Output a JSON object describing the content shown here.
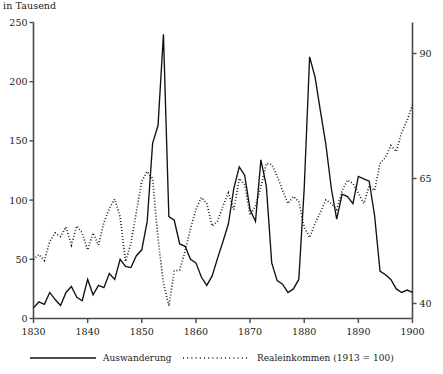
{
  "chart_data": {
    "type": "line",
    "title": "",
    "unit_note": "in Tausend",
    "xlabel": "",
    "ylabel": "",
    "xlim": [
      1830,
      1900
    ],
    "x_ticks": [
      1830,
      1840,
      1850,
      1860,
      1870,
      1880,
      1890,
      1900
    ],
    "x_tick_labels": [
      "1830",
      "1840",
      "1850",
      "1860",
      "1870",
      "1880",
      "1890",
      "1900"
    ],
    "left_axis": {
      "label": "in Tausend",
      "ylim": [
        0,
        250
      ],
      "ticks": [
        0,
        50,
        100,
        150,
        200,
        250
      ],
      "tick_labels": [
        "0",
        "50",
        "100",
        "150",
        "200",
        "250"
      ]
    },
    "right_axis": {
      "label": "Realeinkommen (1913 = 100)",
      "ylim": [
        37,
        96.2
      ],
      "ticks": [
        40,
        65,
        90
      ],
      "tick_labels": [
        "40",
        "65",
        "90"
      ]
    },
    "grid": false,
    "legend_position": "below-plot",
    "series": [
      {
        "name": "Auswanderung",
        "style": "solid",
        "axis": "left",
        "color": "#111111",
        "x": [
          1830,
          1831,
          1832,
          1833,
          1834,
          1835,
          1836,
          1837,
          1838,
          1839,
          1840,
          1841,
          1842,
          1843,
          1844,
          1845,
          1846,
          1847,
          1848,
          1849,
          1850,
          1851,
          1852,
          1853,
          1854,
          1855,
          1856,
          1857,
          1858,
          1859,
          1860,
          1861,
          1862,
          1863,
          1864,
          1865,
          1866,
          1867,
          1868,
          1869,
          1870,
          1871,
          1872,
          1873,
          1874,
          1875,
          1876,
          1877,
          1878,
          1879,
          1880,
          1881,
          1882,
          1883,
          1884,
          1885,
          1886,
          1887,
          1888,
          1889,
          1890,
          1891,
          1892,
          1893,
          1894,
          1895,
          1896,
          1897,
          1898,
          1899,
          1900
        ],
        "values": [
          9,
          14,
          12,
          22,
          16,
          11,
          22,
          27,
          18,
          15,
          33,
          20,
          28,
          26,
          38,
          33,
          50,
          44,
          43,
          53,
          58,
          82,
          148,
          163,
          240,
          86,
          83,
          63,
          61,
          50,
          47,
          35,
          28,
          36,
          51,
          65,
          80,
          110,
          128,
          121,
          92,
          82,
          134,
          112,
          47,
          32,
          29,
          22,
          25,
          33,
          110,
          221,
          204,
          175,
          147,
          110,
          84,
          105,
          103,
          97,
          120,
          118,
          116,
          87,
          40,
          37,
          33,
          25,
          22,
          24,
          22
        ]
      },
      {
        "name": "Realeinkommen (1913 = 100)",
        "style": "dotted",
        "axis": "right",
        "color": "#111111",
        "x": [
          1830,
          1831,
          1832,
          1833,
          1834,
          1835,
          1836,
          1837,
          1838,
          1839,
          1840,
          1841,
          1842,
          1843,
          1844,
          1845,
          1846,
          1847,
          1848,
          1849,
          1850,
          1851,
          1852,
          1853,
          1854,
          1855,
          1856,
          1857,
          1858,
          1859,
          1860,
          1861,
          1862,
          1863,
          1864,
          1865,
          1866,
          1867,
          1868,
          1869,
          1870,
          1871,
          1872,
          1873,
          1874,
          1875,
          1876,
          1877,
          1878,
          1879,
          1880,
          1881,
          1882,
          1883,
          1884,
          1885,
          1886,
          1887,
          1888,
          1889,
          1890,
          1891,
          1892,
          1893,
          1894,
          1895,
          1896,
          1897,
          1898,
          1899,
          1900
        ],
        "values_left_scale": [
          50,
          54,
          49,
          65,
          72,
          69,
          77,
          62,
          78,
          72,
          58,
          72,
          62,
          81,
          93,
          101,
          86,
          48,
          64,
          90,
          116,
          124,
          118,
          68,
          30,
          11,
          40,
          41,
          57,
          76,
          92,
          102,
          97,
          78,
          82,
          95,
          106,
          92,
          118,
          113,
          87,
          95,
          111,
          131,
          130,
          120,
          108,
          97,
          103,
          99,
          77,
          68,
          80,
          90,
          100,
          97,
          92,
          108,
          117,
          114,
          106,
          97,
          112,
          108,
          131,
          136,
          146,
          141,
          157,
          167,
          180
        ],
        "values_right_axis": [
          48.8,
          49.8,
          48.6,
          52.4,
          54.1,
          53.4,
          55.3,
          51.7,
          55.5,
          54.1,
          50.7,
          54.1,
          51.7,
          56.2,
          59.0,
          60.9,
          57.3,
          48.4,
          52.1,
          58.3,
          64.5,
          66.4,
          65.0,
          53.0,
          44.0,
          39.5,
          46.5,
          46.7,
          50.5,
          55.0,
          58.8,
          61.2,
          60.0,
          55.5,
          56.5,
          59.5,
          62.1,
          58.8,
          65.0,
          63.8,
          57.7,
          59.5,
          63.3,
          68.0,
          67.8,
          65.5,
          62.6,
          60.0,
          61.4,
          60.4,
          55.3,
          53.2,
          56.0,
          58.3,
          60.7,
          60.0,
          58.8,
          62.6,
          64.7,
          64.0,
          62.1,
          60.0,
          63.5,
          62.6,
          68.0,
          69.2,
          71.6,
          70.4,
          74.2,
          76.6,
          79.7
        ]
      }
    ]
  },
  "axes": {
    "left_ticks": [
      {
        "value": 250,
        "label": "250"
      },
      {
        "value": 200,
        "label": "200"
      },
      {
        "value": 150,
        "label": "150"
      },
      {
        "value": 100,
        "label": "100"
      },
      {
        "value": 50,
        "label": "50"
      },
      {
        "value": 0,
        "label": "0"
      }
    ],
    "right_ticks": [
      {
        "value": 90,
        "label": "90"
      },
      {
        "value": 65,
        "label": "65"
      },
      {
        "value": 40,
        "label": "40"
      }
    ],
    "x_ticks": [
      {
        "value": 1830,
        "label": "1830"
      },
      {
        "value": 1840,
        "label": "1840"
      },
      {
        "value": 1850,
        "label": "1850"
      },
      {
        "value": 1860,
        "label": "1860"
      },
      {
        "value": 1870,
        "label": "1870"
      },
      {
        "value": 1880,
        "label": "1880"
      },
      {
        "value": 1890,
        "label": "1890"
      },
      {
        "value": 1900,
        "label": "1900"
      }
    ]
  },
  "legend": {
    "items": [
      {
        "label": "Auswanderung",
        "style": "solid"
      },
      {
        "label": "Realeinkommen (1913 = 100)",
        "style": "dotted"
      }
    ]
  }
}
